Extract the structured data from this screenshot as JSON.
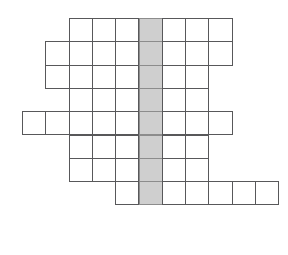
{
  "puzzle": {
    "name": "crossword-grid",
    "type": "empty-crossword-skeleton",
    "rows": 8,
    "columns": 11,
    "cell_size": 23.3,
    "origin_x": 22,
    "origin_y": 18,
    "border_color": "#58585a",
    "cell_fill": "#ffffff",
    "highlight_fill": "#cfcfcf",
    "highlight_border": "#8c8c8c",
    "background": "#ffffff",
    "highlight_column_index": 5,
    "rows_layout": [
      {
        "row": 0,
        "start_col": 2,
        "end_col": 8,
        "count": 7
      },
      {
        "row": 1,
        "start_col": 1,
        "end_col": 8,
        "count": 8
      },
      {
        "row": 2,
        "start_col": 1,
        "end_col": 7,
        "count": 7
      },
      {
        "row": 3,
        "start_col": 2,
        "end_col": 7,
        "count": 6
      },
      {
        "row": 4,
        "start_col": 0,
        "end_col": 8,
        "count": 9
      },
      {
        "row": 5,
        "start_col": 2,
        "end_col": 7,
        "count": 6
      },
      {
        "row": 6,
        "start_col": 2,
        "end_col": 7,
        "count": 6
      },
      {
        "row": 7,
        "start_col": 4,
        "end_col": 10,
        "count": 7
      }
    ],
    "cells": [
      {
        "row": 0,
        "col": 2,
        "highlight": false,
        "label": ""
      },
      {
        "row": 0,
        "col": 3,
        "highlight": false,
        "label": ""
      },
      {
        "row": 0,
        "col": 4,
        "highlight": false,
        "label": ""
      },
      {
        "row": 0,
        "col": 5,
        "highlight": true,
        "label": ""
      },
      {
        "row": 0,
        "col": 6,
        "highlight": false,
        "label": ""
      },
      {
        "row": 0,
        "col": 7,
        "highlight": false,
        "label": ""
      },
      {
        "row": 0,
        "col": 8,
        "highlight": false,
        "label": ""
      },
      {
        "row": 1,
        "col": 1,
        "highlight": false,
        "label": ""
      },
      {
        "row": 1,
        "col": 2,
        "highlight": false,
        "label": ""
      },
      {
        "row": 1,
        "col": 3,
        "highlight": false,
        "label": ""
      },
      {
        "row": 1,
        "col": 4,
        "highlight": false,
        "label": ""
      },
      {
        "row": 1,
        "col": 5,
        "highlight": true,
        "label": ""
      },
      {
        "row": 1,
        "col": 6,
        "highlight": false,
        "label": ""
      },
      {
        "row": 1,
        "col": 7,
        "highlight": false,
        "label": ""
      },
      {
        "row": 1,
        "col": 8,
        "highlight": false,
        "label": ""
      },
      {
        "row": 2,
        "col": 1,
        "highlight": false,
        "label": ""
      },
      {
        "row": 2,
        "col": 2,
        "highlight": false,
        "label": ""
      },
      {
        "row": 2,
        "col": 3,
        "highlight": false,
        "label": ""
      },
      {
        "row": 2,
        "col": 4,
        "highlight": false,
        "label": ""
      },
      {
        "row": 2,
        "col": 5,
        "highlight": true,
        "label": ""
      },
      {
        "row": 2,
        "col": 6,
        "highlight": false,
        "label": ""
      },
      {
        "row": 2,
        "col": 7,
        "highlight": false,
        "label": ""
      },
      {
        "row": 3,
        "col": 2,
        "highlight": false,
        "label": ""
      },
      {
        "row": 3,
        "col": 3,
        "highlight": false,
        "label": ""
      },
      {
        "row": 3,
        "col": 4,
        "highlight": false,
        "label": ""
      },
      {
        "row": 3,
        "col": 5,
        "highlight": true,
        "label": ""
      },
      {
        "row": 3,
        "col": 6,
        "highlight": false,
        "label": ""
      },
      {
        "row": 3,
        "col": 7,
        "highlight": false,
        "label": ""
      },
      {
        "row": 4,
        "col": 0,
        "highlight": false,
        "label": ""
      },
      {
        "row": 4,
        "col": 1,
        "highlight": false,
        "label": ""
      },
      {
        "row": 4,
        "col": 2,
        "highlight": false,
        "label": ""
      },
      {
        "row": 4,
        "col": 3,
        "highlight": false,
        "label": ""
      },
      {
        "row": 4,
        "col": 4,
        "highlight": false,
        "label": ""
      },
      {
        "row": 4,
        "col": 5,
        "highlight": true,
        "label": ""
      },
      {
        "row": 4,
        "col": 6,
        "highlight": false,
        "label": ""
      },
      {
        "row": 4,
        "col": 7,
        "highlight": false,
        "label": ""
      },
      {
        "row": 4,
        "col": 8,
        "highlight": false,
        "label": ""
      },
      {
        "row": 5,
        "col": 2,
        "highlight": false,
        "label": ""
      },
      {
        "row": 5,
        "col": 3,
        "highlight": false,
        "label": ""
      },
      {
        "row": 5,
        "col": 4,
        "highlight": false,
        "label": ""
      },
      {
        "row": 5,
        "col": 5,
        "highlight": true,
        "label": ""
      },
      {
        "row": 5,
        "col": 6,
        "highlight": false,
        "label": ""
      },
      {
        "row": 5,
        "col": 7,
        "highlight": false,
        "label": ""
      },
      {
        "row": 6,
        "col": 2,
        "highlight": false,
        "label": ""
      },
      {
        "row": 6,
        "col": 3,
        "highlight": false,
        "label": ""
      },
      {
        "row": 6,
        "col": 4,
        "highlight": false,
        "label": ""
      },
      {
        "row": 6,
        "col": 5,
        "highlight": true,
        "label": ""
      },
      {
        "row": 6,
        "col": 6,
        "highlight": false,
        "label": ""
      },
      {
        "row": 6,
        "col": 7,
        "highlight": false,
        "label": ""
      },
      {
        "row": 7,
        "col": 4,
        "highlight": false,
        "label": ""
      },
      {
        "row": 7,
        "col": 5,
        "highlight": true,
        "label": ""
      },
      {
        "row": 7,
        "col": 6,
        "highlight": false,
        "label": ""
      },
      {
        "row": 7,
        "col": 7,
        "highlight": false,
        "label": ""
      },
      {
        "row": 7,
        "col": 8,
        "highlight": false,
        "label": ""
      },
      {
        "row": 7,
        "col": 9,
        "highlight": false,
        "label": ""
      },
      {
        "row": 7,
        "col": 10,
        "highlight": false,
        "label": ""
      }
    ]
  }
}
